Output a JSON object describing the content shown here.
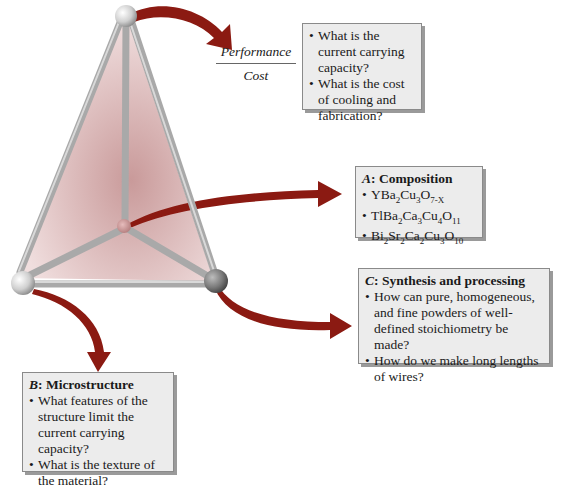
{
  "colors": {
    "arrow": "#8b1a12",
    "box_bg": "#ececec",
    "box_border": "#8a8a8a",
    "rod": "#a8a8a8",
    "face": "#d8b2b2"
  },
  "ratio": {
    "numerator": "Performance",
    "denominator": "Cost"
  },
  "top_box": {
    "items": [
      "What is the current carrying capacity?",
      "What is the cost of cooling and fabrication?"
    ]
  },
  "composition_box": {
    "label_letter": "A",
    "label_text": ": Composition",
    "formulas": [
      {
        "parts": [
          "YBa",
          "2",
          "Cu",
          "3",
          "O",
          "7-X"
        ]
      },
      {
        "parts": [
          "TlBa",
          "2",
          "Ca",
          "3",
          "Cu",
          "4",
          "O",
          "11"
        ]
      },
      {
        "parts": [
          "Bi",
          "2",
          "Sr",
          "2",
          "Ca",
          "2",
          "Cu",
          "3",
          "O",
          "10"
        ]
      }
    ]
  },
  "synthesis_box": {
    "label_letter": "C",
    "label_text": ": Synthesis and processing",
    "items": [
      "How can pure, homogeneous, and fine powders of well-defined stoichiometry be made?",
      "How do we make long lengths of wires?"
    ]
  },
  "microstructure_box": {
    "label_letter": "B",
    "label_text": ": Microstructure",
    "items": [
      "What features of the structure limit the current carrying capacity?",
      "What is the texture of the material?"
    ]
  }
}
